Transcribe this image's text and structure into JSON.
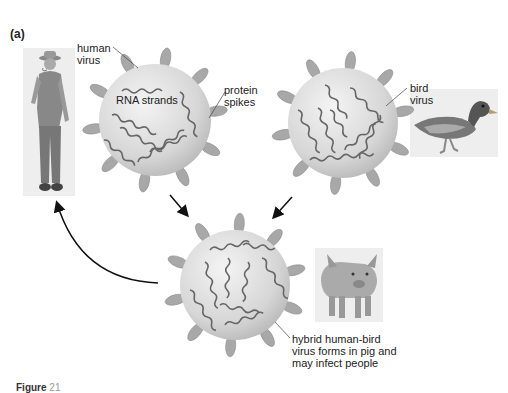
{
  "panel_label": "(a)",
  "labels": {
    "human_virus": [
      "human",
      "virus"
    ],
    "rna_strands": "RNA strands",
    "protein_spikes": [
      "protein",
      "spikes"
    ],
    "bird_virus": [
      "bird",
      "virus"
    ],
    "hybrid": [
      "hybrid human-bird",
      "virus forms in pig and",
      "may infect people"
    ]
  },
  "icons": {
    "human": "farmer-figure",
    "bird": "duck-figure",
    "pig": "pig-figure"
  },
  "caption": {
    "bold": "Figure",
    "rest": " 21"
  },
  "colors": {
    "virus_fill": "#dcdcdc",
    "spike_fill": "#a8a8a8",
    "strand": "#666666",
    "arrow": "#111111"
  }
}
